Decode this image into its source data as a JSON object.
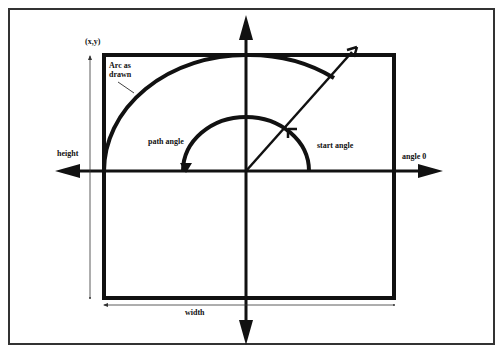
{
  "diagram": {
    "labels": {
      "origin": "(x,y)",
      "arc_as_drawn_line1": "Arc as",
      "arc_as_drawn_line2": "drawn",
      "height": "height",
      "width": "width",
      "path_angle": "path angle",
      "start_angle": "start angle",
      "angle_zero": "angle 0"
    },
    "colors": {
      "stroke": "#111111",
      "frame": "#333333",
      "background": "#ffffff"
    }
  }
}
